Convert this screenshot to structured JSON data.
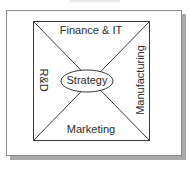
{
  "diagram": {
    "type": "quadrant-box",
    "center": {
      "label": "Strategy",
      "shape": "ellipse"
    },
    "quadrants": {
      "top": "Finance & IT",
      "right": "Manufacturing",
      "bottom": "Marketing",
      "left": "R&D"
    },
    "colors": {
      "line": "#3a3a3a",
      "frame_border": "#8a8a8a",
      "shadow": "#a9a9a9",
      "text": "#2b2b2b",
      "background": "#ffffff"
    }
  }
}
